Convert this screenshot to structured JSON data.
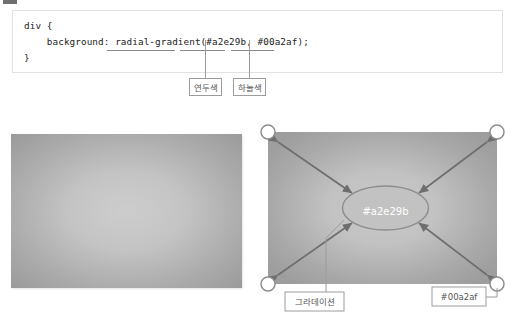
{
  "page": {
    "background": "#ffffff",
    "fragment_color": "#6f6f6f"
  },
  "code_block": {
    "name": "css-code-snippet",
    "lines": [
      "div {",
      "    background: radial-gradient(#a2e29b, #00a2af);",
      "}"
    ],
    "text": "div {\n    background: radial-gradient(#a2e29b, #00a2af);\n}",
    "underlined_tokens": [
      "radial-gradient(",
      "#a2e29b",
      "#00a2af"
    ],
    "border_color": "#e2e2e2",
    "text_color": "#222222"
  },
  "code_callouts": [
    {
      "id": "green",
      "label": "연두색",
      "meaning": "#a2e29b"
    },
    {
      "id": "blue",
      "label": "하늘색",
      "meaning": "#00a2af"
    }
  ],
  "preview": {
    "name": "gradient-preview",
    "center_color": "#cdcdcd",
    "edge_color": "#9a9a9a"
  },
  "diagram": {
    "name": "radial-gradient-diagram",
    "center_label": "#a2e29b",
    "center_label_color": "#ffffff",
    "box_center_color": "#c6c6c6",
    "box_edge_color": "#9f9f9f",
    "arrow_color": "#6e6e6e",
    "handle_count": 4,
    "arrow_count": 8,
    "callouts": [
      {
        "id": "gradation",
        "label": "그라데이션"
      },
      {
        "id": "edge-color",
        "label": "#00a2af"
      }
    ]
  }
}
